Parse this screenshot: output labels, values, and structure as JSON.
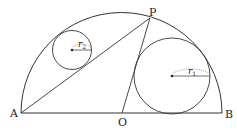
{
  "diagram": {
    "type": "geometry",
    "points": {
      "A": {
        "label": "A"
      },
      "B": {
        "label": "B"
      },
      "O": {
        "label": "O"
      },
      "P": {
        "label": "P"
      }
    },
    "segments": [
      "AB",
      "AP",
      "OP"
    ],
    "circles": [
      {
        "name": "small",
        "radius_label": "r",
        "radius_sub": "2"
      },
      {
        "name": "large",
        "radius_label": "r",
        "radius_sub": "1"
      }
    ],
    "stroke_color": "#333333"
  }
}
